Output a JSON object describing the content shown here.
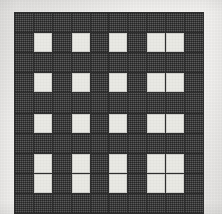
{
  "figure": {
    "name": "checkered-grid-pattern",
    "type": "grid",
    "columns": 10,
    "rows": 10,
    "colors": {
      "dark_cell": "#4a4a4a",
      "light_cell": "#e9e9e4",
      "gridline": "#2f2f2f",
      "page_background": "#f4f3f1"
    },
    "light_cell_columns": [
      2,
      4,
      6,
      8,
      9
    ],
    "light_cell_rows": [
      2,
      4,
      6,
      8,
      9
    ],
    "matrix": [
      [
        "dark",
        "dark",
        "dark",
        "dark",
        "dark",
        "dark",
        "dark",
        "dark",
        "dark",
        "dark"
      ],
      [
        "dark",
        "light",
        "dark",
        "light",
        "dark",
        "light",
        "dark",
        "light",
        "light",
        "dark"
      ],
      [
        "dark",
        "dark",
        "dark",
        "dark",
        "dark",
        "dark",
        "dark",
        "dark",
        "dark",
        "dark"
      ],
      [
        "dark",
        "light",
        "dark",
        "light",
        "dark",
        "light",
        "dark",
        "light",
        "light",
        "dark"
      ],
      [
        "dark",
        "dark",
        "dark",
        "dark",
        "dark",
        "dark",
        "dark",
        "dark",
        "dark",
        "dark"
      ],
      [
        "dark",
        "light",
        "dark",
        "light",
        "dark",
        "light",
        "dark",
        "light",
        "light",
        "dark"
      ],
      [
        "dark",
        "dark",
        "dark",
        "dark",
        "dark",
        "dark",
        "dark",
        "dark",
        "dark",
        "dark"
      ],
      [
        "dark",
        "light",
        "dark",
        "light",
        "dark",
        "light",
        "dark",
        "light",
        "light",
        "dark"
      ],
      [
        "dark",
        "light",
        "dark",
        "light",
        "dark",
        "light",
        "dark",
        "light",
        "light",
        "dark"
      ],
      [
        "dark",
        "dark",
        "dark",
        "dark",
        "dark",
        "dark",
        "dark",
        "dark",
        "dark",
        "dark"
      ]
    ]
  }
}
